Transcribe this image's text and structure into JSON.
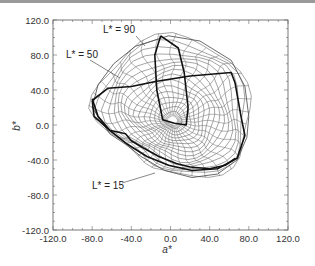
{
  "chart_data": {
    "type": "line",
    "title": "",
    "xlabel": "a*",
    "ylabel": "b*",
    "xlim": [
      -120.0,
      120.0
    ],
    "ylim": [
      -120.0,
      120.0
    ],
    "x_ticks": [
      "-120.0",
      "-80.0",
      "-40.0",
      "0.0",
      "40.0",
      "80.0",
      "120.0"
    ],
    "y_ticks": [
      "120.0",
      "80.0",
      "40.0",
      "0.0",
      "-40.0",
      "-80.0",
      "-120.0"
    ],
    "grid": false,
    "legend": null,
    "annotations": [
      {
        "text": "L* = 90",
        "points_to": [
          -12,
          86
        ]
      },
      {
        "text": "L* = 50",
        "points_to": [
          -60,
          58
        ]
      },
      {
        "text": "L* = 15",
        "points_to": [
          25,
          -55
        ]
      }
    ],
    "series": [
      {
        "name": "L* = 90",
        "style": "thick",
        "points": [
          [
            -10,
            102
          ],
          [
            8,
            88
          ],
          [
            14,
            60
          ],
          [
            18,
            20
          ],
          [
            16,
            0
          ],
          [
            4,
            2
          ],
          [
            -8,
            6
          ],
          [
            -14,
            40
          ],
          [
            -16,
            80
          ],
          [
            -10,
            102
          ]
        ]
      },
      {
        "name": "L* = 50",
        "style": "thick",
        "points": [
          [
            -80,
            28
          ],
          [
            -64,
            42
          ],
          [
            -40,
            44
          ],
          [
            -14,
            50
          ],
          [
            20,
            56
          ],
          [
            62,
            60
          ],
          [
            66,
            48
          ],
          [
            72,
            10
          ],
          [
            76,
            -12
          ],
          [
            68,
            -38
          ],
          [
            48,
            -50
          ],
          [
            22,
            -52
          ],
          [
            -2,
            -46
          ],
          [
            -24,
            -36
          ],
          [
            -44,
            -22
          ],
          [
            -62,
            -6
          ],
          [
            -78,
            10
          ],
          [
            -80,
            28
          ]
        ]
      },
      {
        "name": "L* = 15",
        "style": "thick",
        "points": [
          [
            -80,
            30
          ],
          [
            -74,
            10
          ],
          [
            -62,
            -6
          ],
          [
            -46,
            -10
          ],
          [
            -40,
            -18
          ],
          [
            -28,
            -26
          ],
          [
            -12,
            -36
          ],
          [
            6,
            -44
          ],
          [
            20,
            -48
          ],
          [
            40,
            -50
          ],
          [
            56,
            -46
          ],
          [
            66,
            -38
          ]
        ]
      },
      {
        "name": "outer gamut envelope",
        "style": "thin",
        "points": [
          [
            -2,
            102
          ],
          [
            30,
            96
          ],
          [
            62,
            74
          ],
          [
            76,
            44
          ],
          [
            80,
            10
          ],
          [
            78,
            -14
          ],
          [
            68,
            -40
          ],
          [
            48,
            -56
          ],
          [
            22,
            -60
          ],
          [
            -6,
            -52
          ],
          [
            -30,
            -36
          ],
          [
            -46,
            -22
          ],
          [
            -62,
            -10
          ],
          [
            -80,
            20
          ],
          [
            -74,
            46
          ],
          [
            -58,
            70
          ],
          [
            -36,
            90
          ],
          [
            -2,
            102
          ]
        ]
      }
    ]
  },
  "labels": {
    "l90": "L* = 90",
    "l50": "L* = 50",
    "l15": "L* = 15",
    "xlabel": "a*",
    "ylabel": "b*"
  }
}
